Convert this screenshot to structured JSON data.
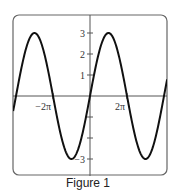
{
  "figure": {
    "caption": "Figure 1"
  },
  "chart_data": {
    "type": "line",
    "title": "",
    "caption": "Figure 1",
    "xlabel": "",
    "ylabel": "",
    "function": "y = 3 sin(x/2)",
    "amplitude": 3,
    "period": "4π",
    "x_ticks": [
      {
        "value": -6.2832,
        "label": "−2π"
      },
      {
        "value": 6.2832,
        "label": "2π"
      }
    ],
    "y_ticks": [
      {
        "value": 3,
        "label": "3"
      },
      {
        "value": 2,
        "label": "2"
      },
      {
        "value": 1,
        "label": "1"
      },
      {
        "value": -1,
        "label": ""
      },
      {
        "value": -2,
        "label": ""
      },
      {
        "value": -3,
        "label": "−3"
      }
    ],
    "xlim": [
      -13.05,
      13.1
    ],
    "ylim": [
      -3.8,
      3.9
    ],
    "grid": false,
    "legend": null,
    "key_points": [
      {
        "x": "-4π",
        "y": 0
      },
      {
        "x": "-3π",
        "y": 3
      },
      {
        "x": "-2π",
        "y": 0
      },
      {
        "x": "-π",
        "y": -3
      },
      {
        "x": "0",
        "y": 0
      },
      {
        "x": "π",
        "y": 3
      },
      {
        "x": "2π",
        "y": 0
      },
      {
        "x": "3π",
        "y": -3
      },
      {
        "x": "4π",
        "y": 0
      }
    ],
    "colors": {
      "curve": "#111111",
      "axes": "#444444",
      "frame": "#666666"
    }
  }
}
